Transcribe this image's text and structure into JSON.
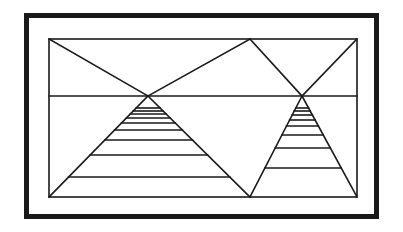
{
  "canvas": {
    "width": 403,
    "height": 232,
    "background_color": "#ffffff",
    "ink_color": "#1a1a1a"
  },
  "figure": {
    "title": "",
    "outer_frame": {
      "name": "outer-border",
      "x": 24,
      "y": 13,
      "width": 355,
      "height": 206,
      "stroke_width": 5,
      "color": "#1a1a1a"
    },
    "inner_frame": {
      "name": "inner-rectangle",
      "x": 49,
      "y": 39,
      "width": 308,
      "height": 158,
      "stroke_width": 1.6,
      "color": "#1a1a1a"
    },
    "horizon": {
      "name": "horizon-line",
      "x1": 49,
      "y1": 96,
      "x2": 357,
      "y2": 96,
      "stroke_width": 1.6
    },
    "vanishing_points": [
      {
        "name": "left-vanishing-point",
        "x": 148,
        "y": 96
      },
      {
        "name": "right-vanishing-point",
        "x": 302,
        "y": 96
      }
    ],
    "apex_points": [
      {
        "name": "top-center-apex",
        "x": 250,
        "y": 39
      },
      {
        "name": "bottom-center-apex",
        "x": 250,
        "y": 197
      }
    ],
    "rays": [
      {
        "name": "ray-topleft-to-left-vp",
        "x1": 49,
        "y1": 39,
        "x2": 148,
        "y2": 96
      },
      {
        "name": "ray-left-vp-to-bottom-center",
        "x1": 148,
        "y1": 96,
        "x2": 250,
        "y2": 197
      },
      {
        "name": "ray-top-center-to-left-vp",
        "x1": 250,
        "y1": 39,
        "x2": 148,
        "y2": 96
      },
      {
        "name": "ray-left-vp-to-bottomleft",
        "x1": 148,
        "y1": 96,
        "x2": 49,
        "y2": 197
      },
      {
        "name": "ray-top-center-to-right-vp",
        "x1": 250,
        "y1": 39,
        "x2": 302,
        "y2": 96
      },
      {
        "name": "ray-right-vp-to-bottomright",
        "x1": 302,
        "y1": 96,
        "x2": 357,
        "y2": 197
      },
      {
        "name": "ray-topright-to-right-vp",
        "x1": 357,
        "y1": 39,
        "x2": 302,
        "y2": 96
      },
      {
        "name": "ray-right-vp-to-bottom-center",
        "x1": 302,
        "y1": 96,
        "x2": 250,
        "y2": 197
      }
    ],
    "left_ladder": {
      "name": "left-rung-group",
      "apex_x": 148,
      "apex_y": 96,
      "left_base_x": 49,
      "right_base_x": 250,
      "base_y": 197,
      "rung_count": 9,
      "rung_y": [
        108,
        111,
        114,
        118,
        123,
        130,
        140,
        155,
        177
      ],
      "stroke_width": 1.6
    },
    "right_ladder": {
      "name": "right-rung-group",
      "apex_x": 302,
      "apex_y": 96,
      "left_base_x": 250,
      "right_base_x": 357,
      "base_y": 197,
      "rung_count": 8,
      "rung_y": [
        108,
        111,
        115,
        120,
        126,
        135,
        148,
        168
      ],
      "stroke_width": 1.6
    }
  }
}
